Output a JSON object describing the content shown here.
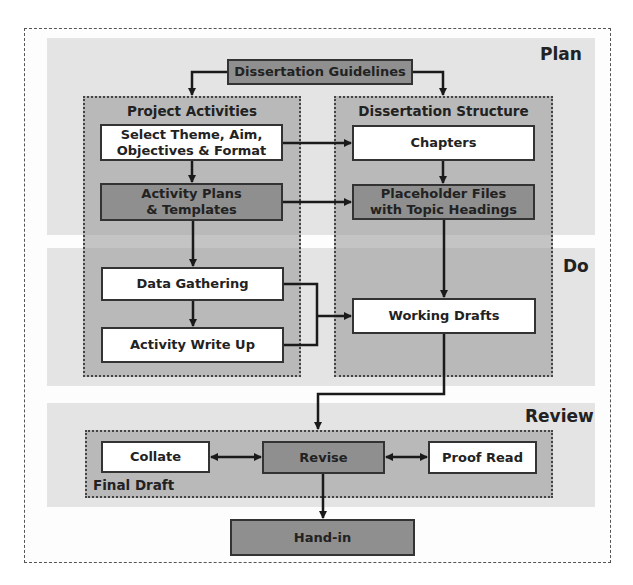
{
  "phases": {
    "plan": "Plan",
    "do": "Do",
    "review": "Review"
  },
  "groups": {
    "project_activities": "Project Activities",
    "dissertation_structure": "Dissertation Structure",
    "final_draft": "Final Draft"
  },
  "nodes": {
    "guidelines": "Dissertation Guidelines",
    "select_theme_l1": "Select Theme, Aim,",
    "select_theme_l2": "Objectives & Format",
    "activity_plans_l1": "Activity Plans",
    "activity_plans_l2": "& Templates",
    "chapters": "Chapters",
    "placeholder_l1": "Placeholder Files",
    "placeholder_l2": "with Topic Headings",
    "data_gathering": "Data Gathering",
    "activity_write_up": "Activity Write Up",
    "working_drafts": "Working Drafts",
    "collate": "Collate",
    "revise": "Revise",
    "proof_read": "Proof Read",
    "hand_in": "Hand-in"
  },
  "colors": {
    "band": "#e4e4e4",
    "group": "#a8a8a8",
    "dark_node": "#8f8f8f",
    "light_node": "#ffffff",
    "line": "#1a1a1a"
  }
}
